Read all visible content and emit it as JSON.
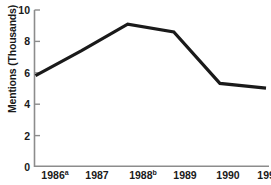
{
  "chart_data": {
    "type": "line",
    "title": "",
    "xlabel": "",
    "ylabel": "Mentions (Thousands)",
    "categories": [
      "1986",
      "1987",
      "1988",
      "1989",
      "1990",
      "1991"
    ],
    "category_superscripts": [
      "a",
      "",
      "b",
      "",
      "",
      ""
    ],
    "values": [
      5.8,
      7.4,
      9.1,
      8.6,
      5.3,
      5.0
    ],
    "ylim": [
      0,
      10
    ],
    "yticks": [
      0,
      2,
      4,
      6,
      8,
      10
    ],
    "ytick_labels": [
      "0",
      "2",
      "4",
      "6",
      "8",
      "10"
    ],
    "grid": false,
    "legend": null,
    "series_color": "#1a1a1a",
    "axis_color": "#8c8c8c"
  },
  "axes": {
    "y_label_text": "Mentions (Thousands)"
  }
}
